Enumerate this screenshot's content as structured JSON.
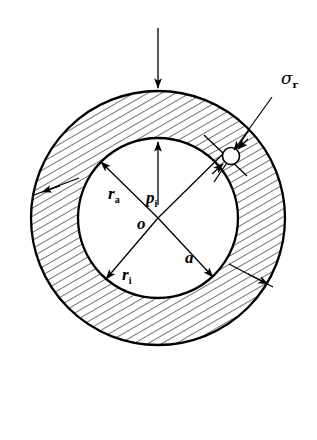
{
  "figure": {
    "background_color": "#ffffff",
    "line_color": "#000000",
    "hatch_color": "#000000",
    "geometry": {
      "center_x": 158,
      "center_y": 218,
      "outer_radius": 127,
      "inner_radius": 80,
      "hatch_angle_deg": 60,
      "hatch_spacing": 7
    },
    "labels": {
      "sigma_r": {
        "symbol": "σ",
        "subscript": "r",
        "x": 281,
        "y": 84
      },
      "r_a": {
        "symbol": "r",
        "subscript": "a",
        "x": 108,
        "y": 199
      },
      "r_i": {
        "symbol": "r",
        "subscript": "i",
        "x": 122,
        "y": 280
      },
      "p_i": {
        "symbol": "p",
        "subscript": "i",
        "x": 146,
        "y": 203
      },
      "a": {
        "symbol": "a",
        "subscript": "",
        "x": 185,
        "y": 263
      },
      "o": {
        "symbol": "o",
        "subscript": "",
        "x": 137,
        "y": 229
      }
    },
    "annotations": {
      "load_arrow": {
        "name": "external-load-arrow",
        "from_y": 28,
        "to_y": 90
      },
      "element_circle": {
        "name": "stress-element-circle",
        "x": 232,
        "y": 155,
        "r": 8
      },
      "pressure_arrow": {
        "name": "internal-pressure-arrow",
        "points_to": "inner wall"
      },
      "radius_arrows": [
        "r_a",
        "r_i",
        "a"
      ],
      "wall_segments": 2
    }
  }
}
